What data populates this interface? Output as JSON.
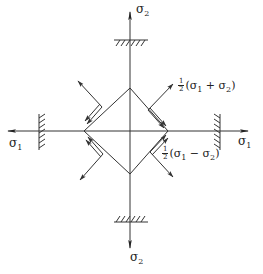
{
  "diagram": {
    "type": "stress-element-diagram",
    "stroke_color": "#333333",
    "labels": {
      "sigma2_top": {
        "base": "σ",
        "sub": "2"
      },
      "sigma2_bottom": {
        "base": "σ",
        "sub": "2"
      },
      "sigma1_left": {
        "base": "σ",
        "sub": "1"
      },
      "sigma1_right": {
        "base": "σ",
        "sub": "1"
      },
      "normal_stress": {
        "frac_num": "1",
        "frac_den": "2",
        "open": "(σ",
        "s1": "1",
        "op": " + σ",
        "s2": "2",
        "close": ")"
      },
      "shear_stress": {
        "frac_num": "1",
        "frac_den": "2",
        "open": "(σ",
        "s1": "1",
        "op": " − σ",
        "s2": "2",
        "close": ")"
      }
    },
    "nodes": [
      "vertical-axis",
      "horizontal-axis",
      "top-support",
      "bottom-support",
      "left-support",
      "right-support",
      "rotated-element",
      "face-stress-arrows"
    ],
    "edges": [
      {
        "from": "top-support",
        "to": "rotated-element",
        "label": "σ2"
      },
      {
        "from": "left-support",
        "to": "rotated-element",
        "label": "σ1"
      }
    ]
  }
}
